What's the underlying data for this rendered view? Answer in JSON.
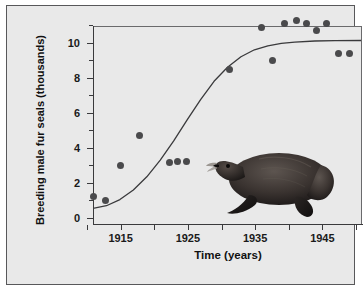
{
  "figure": {
    "background_color": "#e9e9e9",
    "frame_color": "#58585a",
    "point_color": "#4a4a4c",
    "curve_color": "#3a3a3c",
    "illustration": "fur-seal"
  },
  "chart_data": {
    "type": "scatter",
    "title": "",
    "xlabel": "Time (years)",
    "ylabel": "Breeding male fur seals (thousands)",
    "xlim": [
      1910,
      1950
    ],
    "ylim": [
      0,
      11.3
    ],
    "grid": false,
    "legend": null,
    "x_ticks": [
      1910,
      1915,
      1920,
      1925,
      1930,
      1935,
      1940,
      1945,
      1950
    ],
    "x_tick_labels": [
      "",
      "1915",
      "",
      "1925",
      "",
      "1935",
      "",
      "1945",
      ""
    ],
    "y_ticks": [
      0,
      1,
      2,
      3,
      4,
      5,
      6,
      7,
      8,
      9,
      10,
      11
    ],
    "y_tick_labels": [
      "0",
      "",
      "2",
      "",
      "4",
      "",
      "6",
      "",
      "8",
      "",
      "10",
      ""
    ],
    "points": [
      {
        "x": 1911.0,
        "y": 1.2
      },
      {
        "x": 1912.8,
        "y": 1.0
      },
      {
        "x": 1915.0,
        "y": 3.0
      },
      {
        "x": 1917.8,
        "y": 4.7
      },
      {
        "x": 1922.2,
        "y": 3.15
      },
      {
        "x": 1923.4,
        "y": 3.2
      },
      {
        "x": 1924.8,
        "y": 3.2
      },
      {
        "x": 1931.2,
        "y": 8.5
      },
      {
        "x": 1936.0,
        "y": 10.9
      },
      {
        "x": 1937.6,
        "y": 9.0
      },
      {
        "x": 1939.4,
        "y": 11.1
      },
      {
        "x": 1941.2,
        "y": 11.25
      },
      {
        "x": 1942.6,
        "y": 11.1
      },
      {
        "x": 1944.2,
        "y": 10.7
      },
      {
        "x": 1945.6,
        "y": 11.1
      },
      {
        "x": 1947.4,
        "y": 9.4
      },
      {
        "x": 1949.0,
        "y": 9.4
      }
    ],
    "fit_curve": {
      "name": "logistic growth curve",
      "carrying_capacity": 10.5,
      "points": [
        {
          "x": 1910.0,
          "y": 0.95
        },
        {
          "x": 1912.0,
          "y": 1.1
        },
        {
          "x": 1914.0,
          "y": 1.45
        },
        {
          "x": 1916.0,
          "y": 2.0
        },
        {
          "x": 1918.0,
          "y": 2.75
        },
        {
          "x": 1920.0,
          "y": 3.7
        },
        {
          "x": 1922.0,
          "y": 4.8
        },
        {
          "x": 1924.0,
          "y": 6.0
        },
        {
          "x": 1926.0,
          "y": 7.15
        },
        {
          "x": 1928.0,
          "y": 8.2
        },
        {
          "x": 1930.0,
          "y": 9.0
        },
        {
          "x": 1932.0,
          "y": 9.6
        },
        {
          "x": 1934.0,
          "y": 10.0
        },
        {
          "x": 1936.0,
          "y": 10.22
        },
        {
          "x": 1938.0,
          "y": 10.36
        },
        {
          "x": 1940.0,
          "y": 10.44
        },
        {
          "x": 1943.0,
          "y": 10.5
        },
        {
          "x": 1946.0,
          "y": 10.52
        },
        {
          "x": 1950.0,
          "y": 10.53
        }
      ]
    }
  }
}
